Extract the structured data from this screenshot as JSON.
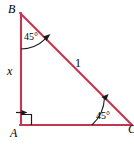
{
  "figure": {
    "type": "right-triangle-diagram",
    "width": 134,
    "height": 144,
    "background_color": "#ffffff",
    "stroke_color": "#c2374f",
    "mark_color": "#1a1a1a",
    "vertices": {
      "A": {
        "label": "A",
        "x": 21,
        "y": 125,
        "role": "right-angle-vertex"
      },
      "B": {
        "label": "B",
        "x": 20,
        "y": 13,
        "role": "top-vertex"
      },
      "C": {
        "label": "C",
        "x": 131,
        "y": 125,
        "role": "right-vertex"
      }
    },
    "sides": [
      {
        "name": "AB",
        "label": "x",
        "kind": "vertical-leg"
      },
      {
        "name": "BC",
        "label": "1",
        "kind": "hypotenuse"
      },
      {
        "name": "AC",
        "label": "",
        "kind": "horizontal-leg"
      }
    ],
    "angles": [
      {
        "at": "B",
        "label": "45°",
        "value": 45,
        "mark": "arc-with-arrow"
      },
      {
        "at": "C",
        "label": "45°",
        "value": 45,
        "mark": "arc-with-arrow"
      },
      {
        "at": "A",
        "label": "",
        "value": 90,
        "mark": "right-angle-square-with-leader-arrow"
      }
    ]
  }
}
